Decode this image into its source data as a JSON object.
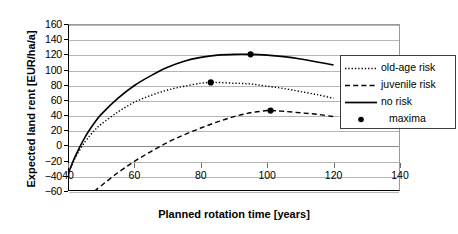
{
  "chart_data": {
    "type": "line",
    "title": "",
    "xlabel": "Planned rotation time [years]",
    "ylabel": "Expected land rent [EUR/ha/a]",
    "xlim": [
      40,
      140
    ],
    "ylim": [
      -60,
      160
    ],
    "xticks": [
      40,
      60,
      80,
      100,
      120,
      140
    ],
    "yticks": [
      -60,
      -40,
      -20,
      0,
      20,
      40,
      60,
      80,
      100,
      120,
      140,
      160
    ],
    "grid": true,
    "legend_position": "right",
    "series": [
      {
        "name": "old-age risk",
        "style": "dotted",
        "x": [
          40,
          42,
          45,
          48,
          50,
          55,
          60,
          65,
          70,
          75,
          80,
          83,
          85,
          90,
          95,
          100,
          105,
          110,
          115,
          120
        ],
        "y": [
          -38,
          -18,
          4,
          20,
          28,
          44,
          57,
          66,
          73,
          78,
          82,
          83,
          83,
          82,
          81,
          78,
          75,
          71,
          67,
          62
        ]
      },
      {
        "name": "juvenile risk",
        "style": "dashed",
        "x": [
          48,
          50,
          55,
          60,
          65,
          70,
          75,
          80,
          85,
          90,
          95,
          100,
          101,
          105,
          110,
          115,
          120
        ],
        "y": [
          -60,
          -53,
          -36,
          -21,
          -8,
          4,
          14,
          23,
          31,
          38,
          43,
          46,
          46,
          45,
          43,
          41,
          38
        ]
      },
      {
        "name": "no risk",
        "style": "solid",
        "x": [
          40,
          42,
          45,
          48,
          50,
          55,
          60,
          65,
          70,
          75,
          80,
          85,
          90,
          95,
          100,
          105,
          110,
          115,
          120
        ],
        "y": [
          -38,
          -16,
          10,
          30,
          41,
          62,
          79,
          92,
          103,
          111,
          116,
          119,
          120,
          120,
          119,
          117,
          114,
          110,
          106
        ]
      }
    ],
    "maxima": [
      {
        "series": "no risk",
        "x": 95,
        "y": 120
      },
      {
        "series": "old-age risk",
        "x": 83,
        "y": 83
      },
      {
        "series": "juvenile risk",
        "x": 101,
        "y": 46
      }
    ],
    "legend_entries": [
      {
        "label": "old-age risk",
        "marker": "dotted-line"
      },
      {
        "label": "juvenile risk",
        "marker": "dashed-line"
      },
      {
        "label": "no risk",
        "marker": "solid-line"
      },
      {
        "label": "maxima",
        "marker": "filled-circle"
      }
    ],
    "colors": {
      "line": "#000000",
      "grid": "#b5b5b5",
      "axis": "#000000",
      "background": "#ffffff"
    }
  }
}
